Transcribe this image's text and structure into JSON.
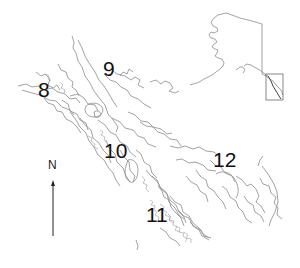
{
  "map": {
    "region_labels": [
      {
        "id": "8",
        "text": "8"
      },
      {
        "id": "9",
        "text": "9"
      },
      {
        "id": "10",
        "text": "10"
      },
      {
        "id": "11",
        "text": "11"
      },
      {
        "id": "12",
        "text": "12"
      }
    ],
    "north_arrow": {
      "label": "N"
    },
    "inset": {
      "subject": "Alaska",
      "highlight": "Southeast Alaska study area box"
    },
    "colors": {
      "coastline": "#8a8a8a",
      "inset_outline": "#555555",
      "label_text": "#111111",
      "background": "#ffffff"
    }
  }
}
